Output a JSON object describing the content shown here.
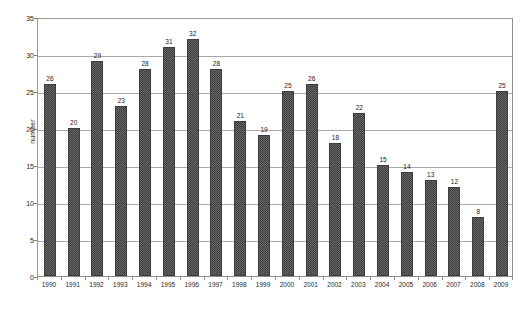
{
  "chart_data": {
    "type": "bar",
    "title": "",
    "subtitle": "",
    "xlabel": "",
    "ylabel": "number",
    "categories": [
      "1990",
      "1991",
      "1992",
      "1993",
      "1994",
      "1995",
      "1996",
      "1997",
      "1998",
      "1999",
      "2000",
      "2001",
      "2002",
      "2003",
      "2004",
      "2005",
      "2006",
      "2007",
      "2008",
      "2009"
    ],
    "values": [
      26,
      20,
      29,
      23,
      28,
      31,
      32,
      28,
      21,
      19,
      25,
      26,
      18,
      22,
      15,
      14,
      13,
      12,
      8,
      25
    ],
    "ylim": [
      0,
      35
    ],
    "ytick_values": [
      0,
      5,
      10,
      15,
      20,
      25,
      30,
      35
    ],
    "ytick_labels": [
      "0",
      "5",
      "10",
      "15",
      "20",
      "25",
      "30",
      "35"
    ],
    "grid": true,
    "grid_axis": "y",
    "legend": false,
    "legend_position": "none",
    "data_labels": true,
    "series": [
      {
        "name": "number",
        "values": [
          26,
          20,
          29,
          23,
          28,
          31,
          32,
          28,
          21,
          19,
          25,
          26,
          18,
          22,
          15,
          14,
          13,
          12,
          8,
          25
        ]
      }
    ]
  },
  "style": {
    "background": "#ffffff",
    "bar_fill": "#6b6b6b",
    "bar_pattern": "checkerboard-dither",
    "bar_border": "#3d3d3d",
    "gridline_color": "#a9a9a9",
    "axis_color": "#8d8d8d",
    "text_color": "#1a1a1a"
  }
}
